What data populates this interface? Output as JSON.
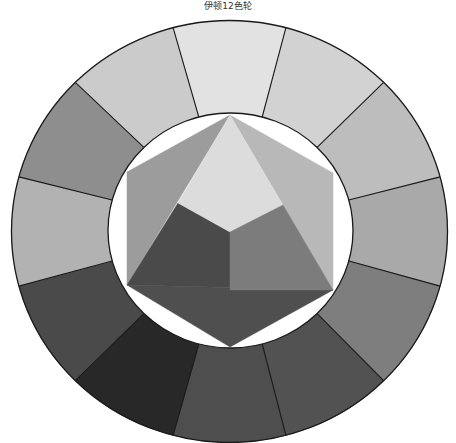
{
  "title": "伊顿12色轮",
  "geometry": {
    "outer": {
      "cx": 229.5,
      "cy": 231.5,
      "rx": 218,
      "ry": 211
    },
    "inner": {
      "cx": 230.5,
      "cy": 230.5,
      "rx": 122.5,
      "ry": 117.5
    },
    "stroke": "#1a1a1a"
  },
  "wheel_segments": [
    {
      "angle": 90,
      "color": "#e2e2e2"
    },
    {
      "angle": 60,
      "color": "#d2d2d2"
    },
    {
      "angle": 30,
      "color": "#bdbdbd"
    },
    {
      "angle": 0,
      "color": "#a9a9a9"
    },
    {
      "angle": -30,
      "color": "#7e7e7e"
    },
    {
      "angle": -60,
      "color": "#525252"
    },
    {
      "angle": -90,
      "color": "#4e4e4e"
    },
    {
      "angle": -120,
      "color": "#282828"
    },
    {
      "angle": -150,
      "color": "#4a4a4a"
    },
    {
      "angle": 180,
      "color": "#b2b2b2"
    },
    {
      "angle": 150,
      "color": "#8e8e8e"
    },
    {
      "angle": 120,
      "color": "#cbcbcb"
    }
  ],
  "inner_shapes": [
    {
      "name": "left-outer-triangle",
      "points": "230,115 127,172 127,285",
      "color": "#9c9c9c"
    },
    {
      "name": "right-outer-triangle",
      "points": "230,115 333,173 333,290",
      "color": "#b8b8b8"
    },
    {
      "name": "bottom-outer-triangle",
      "points": "127,285 333,290 230,347",
      "color": "#4f4f4f"
    },
    {
      "name": "left-dark-rhombus",
      "points": "178,203 230,232 230,290 333,290 127,285",
      "color": "#4a4a4a"
    },
    {
      "name": "top-light-rhombus",
      "points": "230,115 283,205 230,232 178,203",
      "color": "#dcdcdc"
    },
    {
      "name": "right-medium-rhombus",
      "points": "230,232 283,205 333,290 230,290",
      "color": "#7c7c7c"
    }
  ]
}
